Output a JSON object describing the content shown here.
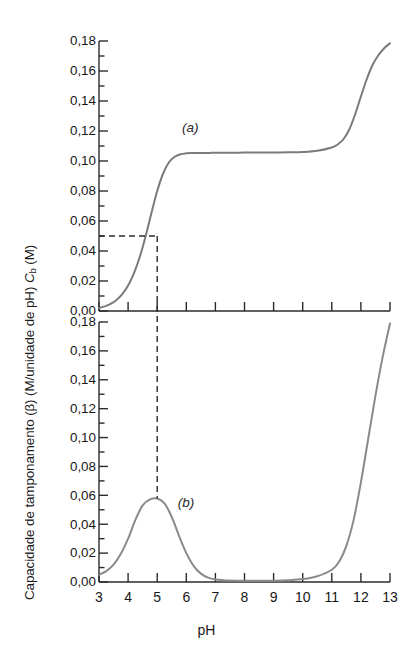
{
  "figure": {
    "top_sliver_text": "",
    "x_axis_title": "pH",
    "y_axis_title_prefix": "Capacidade de tamponamento (β) (M/unidade de pH) ",
    "y_axis_title_symbol": "C",
    "y_axis_title_subscript": "b",
    "y_axis_title_suffix": " (M)"
  },
  "chart_data": {
    "type": "line",
    "title": "",
    "xlabel": "pH",
    "ylabel": "Capacidade de tamponamento (β) (M/unidade de pH) C_b (M)",
    "xlim": [
      3,
      13
    ],
    "ylim": [
      0.0,
      0.18
    ],
    "grid": false,
    "legend": "inline-annotations",
    "x_ticks": [
      3,
      4,
      5,
      6,
      7,
      8,
      9,
      10,
      11,
      12,
      13
    ],
    "x_tick_labels": [
      "3",
      "4",
      "5",
      "6",
      "7",
      "8",
      "9",
      "10",
      "11",
      "12",
      "13"
    ],
    "y_ticks": [
      0.0,
      0.02,
      0.04,
      0.06,
      0.08,
      0.1,
      0.12,
      0.14,
      0.16,
      0.18
    ],
    "y_tick_labels": [
      "0,00",
      "0,02",
      "0,04",
      "0,06",
      "0,08",
      "0,10",
      "0,12",
      "0,14",
      "0,16",
      "0,18"
    ],
    "minor_ticks_per_interval": 1,
    "panels": [
      {
        "id": "a",
        "annotation": "(a)",
        "annotation_x": 6.3,
        "annotation_y": 0.122,
        "ylabel": "C_b (M)",
        "ylim": [
          0.0,
          0.18
        ],
        "series": [
          {
            "name": "Titration curve (a)",
            "color": "#7b7b7b",
            "x": [
              3.0,
              3.2,
              3.4,
              3.6,
              3.8,
              4.0,
              4.2,
              4.4,
              4.6,
              4.8,
              5.0,
              5.2,
              5.4,
              5.6,
              5.8,
              6.0,
              6.2,
              6.4,
              6.6,
              6.8,
              7.0,
              7.5,
              8.0,
              8.5,
              9.0,
              9.5,
              10.0,
              10.5,
              11.0,
              11.2,
              11.4,
              11.6,
              11.8,
              12.0,
              12.2,
              12.4,
              12.6,
              12.8,
              13.0
            ],
            "y": [
              0.002,
              0.0031,
              0.0048,
              0.0074,
              0.0113,
              0.017,
              0.0251,
              0.036,
              0.0497,
              0.0652,
              0.08,
              0.0915,
              0.099,
              0.1028,
              0.1045,
              0.1051,
              0.1053,
              0.1054,
              0.1054,
              0.1054,
              0.1055,
              0.1055,
              0.1056,
              0.1056,
              0.1057,
              0.1058,
              0.106,
              0.1068,
              0.109,
              0.111,
              0.1145,
              0.121,
              0.131,
              0.143,
              0.1545,
              0.164,
              0.1705,
              0.1752,
              0.1785
            ]
          }
        ],
        "dashed_guides": {
          "horizontal_y": 0.05,
          "vertical_x": 5.0,
          "description": "Dashed lines mark C_b = 0,05 M at pH 5"
        }
      },
      {
        "id": "b",
        "annotation": "(b)",
        "annotation_x": 6.15,
        "annotation_y": 0.055,
        "ylabel": "β (M/unidade de pH)",
        "ylim": [
          0.0,
          0.18
        ],
        "series": [
          {
            "name": "Buffer capacity curve (b)",
            "color": "#8a8a8a",
            "x": [
              3.0,
              3.25,
              3.5,
              3.75,
              4.0,
              4.25,
              4.5,
              4.75,
              5.0,
              5.25,
              5.5,
              5.75,
              6.0,
              6.25,
              6.5,
              6.75,
              7.0,
              7.5,
              8.0,
              8.5,
              9.0,
              9.5,
              10.0,
              10.5,
              11.0,
              11.25,
              11.5,
              11.75,
              12.0,
              12.25,
              12.5,
              12.75,
              13.0
            ],
            "y": [
              0.005,
              0.0075,
              0.012,
              0.0195,
              0.03,
              0.043,
              0.053,
              0.0572,
              0.0578,
              0.0545,
              0.045,
              0.032,
              0.02,
              0.0112,
              0.0058,
              0.003,
              0.0018,
              0.001,
              0.0008,
              0.0008,
              0.0009,
              0.0012,
              0.002,
              0.004,
              0.0085,
              0.014,
              0.025,
              0.043,
              0.069,
              0.099,
              0.129,
              0.156,
              0.179
            ]
          }
        ],
        "peak": {
          "x": 5.0,
          "y": 0.0578
        },
        "dashed_guides": {
          "vertical_x": 5.0,
          "description": "Dashed vertical line at pH 5 aligning the buffer-capacity maximum with the titration mid-point"
        }
      }
    ]
  }
}
